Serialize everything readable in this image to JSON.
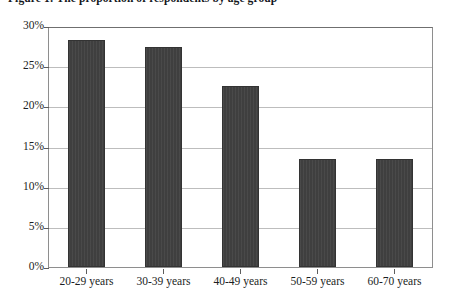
{
  "caption": {
    "text": "Figure 1: The proportion of respondents by age group"
  },
  "chart_data": {
    "type": "bar",
    "title": "",
    "xlabel": "",
    "ylabel": "",
    "categories": [
      "20-29 years",
      "30-39 years",
      "40-49 years",
      "50-59 years",
      "60-70 years"
    ],
    "values": [
      28.2,
      27.4,
      22.5,
      13.5,
      13.5
    ],
    "ytick_labels": [
      "0%",
      "5%",
      "10%",
      "15%",
      "20%",
      "25%",
      "30%"
    ],
    "ytick_values": [
      0,
      5,
      10,
      15,
      20,
      25,
      30
    ],
    "ylim": [
      0,
      30
    ],
    "grid": true,
    "legend": "none",
    "bar_color": "#3f3f3f",
    "gridline_color": "#bdbdbd",
    "axis_color": "#5d5d5d"
  }
}
